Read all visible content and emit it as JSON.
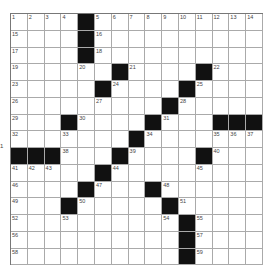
{
  "puzzle": {
    "rows": 15,
    "cols": 15,
    "blocks": [
      [
        0,
        4
      ],
      [
        1,
        4
      ],
      [
        2,
        4
      ],
      [
        3,
        6
      ],
      [
        3,
        11
      ],
      [
        4,
        5
      ],
      [
        4,
        10
      ],
      [
        5,
        9
      ],
      [
        6,
        3
      ],
      [
        6,
        8
      ],
      [
        6,
        12
      ],
      [
        6,
        13
      ],
      [
        6,
        14
      ],
      [
        7,
        7
      ],
      [
        8,
        0
      ],
      [
        8,
        1
      ],
      [
        8,
        2
      ],
      [
        8,
        6
      ],
      [
        8,
        11
      ],
      [
        9,
        5
      ],
      [
        10,
        4
      ],
      [
        10,
        8
      ],
      [
        11,
        3
      ],
      [
        11,
        9
      ],
      [
        12,
        10
      ],
      [
        13,
        10
      ],
      [
        14,
        10
      ]
    ],
    "numbers": [
      [
        0,
        0,
        1
      ],
      [
        0,
        1,
        2
      ],
      [
        0,
        2,
        3
      ],
      [
        0,
        3,
        4
      ],
      [
        0,
        5,
        5
      ],
      [
        0,
        6,
        6
      ],
      [
        0,
        7,
        7
      ],
      [
        0,
        8,
        8
      ],
      [
        0,
        9,
        9
      ],
      [
        0,
        10,
        10
      ],
      [
        0,
        11,
        11
      ],
      [
        0,
        12,
        12
      ],
      [
        0,
        13,
        13
      ],
      [
        0,
        14,
        14
      ],
      [
        1,
        0,
        15
      ],
      [
        1,
        5,
        16
      ],
      [
        2,
        0,
        17
      ],
      [
        2,
        5,
        18
      ],
      [
        3,
        0,
        19
      ],
      [
        3,
        4,
        20
      ],
      [
        3,
        7,
        21
      ],
      [
        3,
        12,
        22
      ],
      [
        4,
        0,
        23
      ],
      [
        4,
        6,
        24
      ],
      [
        4,
        11,
        25
      ],
      [
        5,
        0,
        26
      ],
      [
        5,
        5,
        27
      ],
      [
        5,
        10,
        28
      ],
      [
        6,
        0,
        29
      ],
      [
        6,
        4,
        30
      ],
      [
        6,
        9,
        31
      ],
      [
        7,
        0,
        32
      ],
      [
        7,
        3,
        33
      ],
      [
        7,
        8,
        34
      ],
      [
        7,
        12,
        35
      ],
      [
        7,
        13,
        36
      ],
      [
        7,
        14,
        37
      ],
      [
        8,
        3,
        38
      ],
      [
        8,
        7,
        39
      ],
      [
        8,
        12,
        40
      ],
      [
        9,
        0,
        41
      ],
      [
        9,
        1,
        42
      ],
      [
        9,
        2,
        43
      ],
      [
        9,
        6,
        44
      ],
      [
        9,
        11,
        45
      ],
      [
        10,
        0,
        46
      ],
      [
        10,
        5,
        47
      ],
      [
        10,
        9,
        48
      ],
      [
        11,
        0,
        49
      ],
      [
        11,
        4,
        50
      ],
      [
        11,
        10,
        51
      ],
      [
        12,
        0,
        52
      ],
      [
        12,
        3,
        53
      ],
      [
        12,
        9,
        54
      ],
      [
        12,
        11,
        55
      ],
      [
        13,
        0,
        56
      ],
      [
        13,
        11,
        57
      ],
      [
        14,
        0,
        58
      ],
      [
        14,
        11,
        59
      ]
    ]
  },
  "edge_label": "1"
}
